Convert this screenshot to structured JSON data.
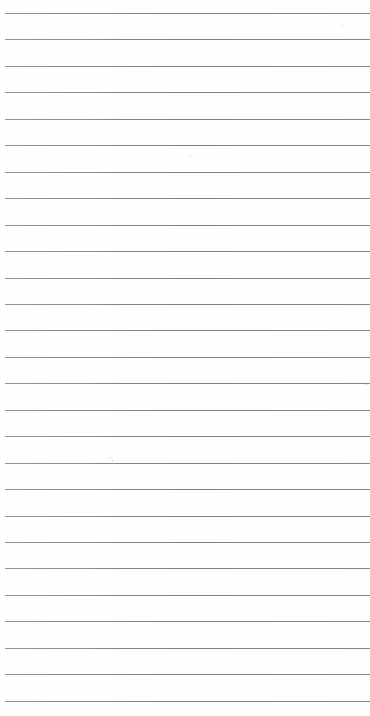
{
  "page": {
    "type": "lined-paper",
    "background_color": "#ffffff",
    "rule_color": "#777777",
    "rule_count": 27,
    "first_rule_y": 13,
    "rule_spacing": 26.45
  }
}
